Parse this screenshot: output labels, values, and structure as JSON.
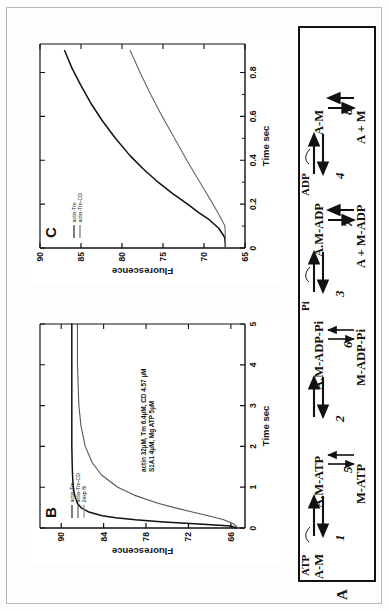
{
  "figure": {
    "panels": [
      "A",
      "B",
      "C"
    ]
  },
  "panelA": {
    "label": "A",
    "species": {
      "am_left": "A-M",
      "am_atp": "A.M-ATP",
      "am_adp_pi": "A.M-ADP-Pi",
      "am_adp": "A.M-ADP",
      "am_right": "A-M",
      "m_atp": "M-ATP",
      "m_adp_pi": "M-ADP-Pi",
      "a_plus_m_adp": "A + M-ADP",
      "a_plus_m": "A + M"
    },
    "ligands": {
      "atp": "ATP",
      "pi": "Pi",
      "adp": "ADP"
    },
    "steps": {
      "s1": "1",
      "s2": "2",
      "s3": "3",
      "s4": "4",
      "s5": "5",
      "s6": "6",
      "s7": "7",
      "s8": "8"
    }
  },
  "chart_data": [
    {
      "id": "panelB",
      "type": "line",
      "title": "B",
      "xlabel": "Time sec",
      "ylabel": "Fluorescence",
      "xlim": [
        0,
        5
      ],
      "ylim": [
        64,
        93
      ],
      "xticks": [
        "0",
        "1",
        "2",
        "3",
        "4",
        "5"
      ],
      "xtickvals": [
        0,
        1,
        2,
        3,
        4,
        5
      ],
      "yticks": [
        "66",
        "72",
        "78",
        "84",
        "90"
      ],
      "ytickvals": [
        66,
        72,
        78,
        84,
        90
      ],
      "grid": false,
      "legend_position": "upper-left",
      "annotation": [
        "actin 32µM, Tm 6.4µM, CD 4.57 µM",
        "S1A1 4µM, Mg ATP 5µM"
      ],
      "legend": [
        {
          "name": "actin-Tm",
          "color": "#111111"
        },
        {
          "name": "actin-Tm-CD",
          "color": "#555555"
        },
        {
          "name": "2exp fit",
          "color": "#888888"
        }
      ],
      "series": [
        {
          "name": "actin-Tm",
          "color": "#111111",
          "x": [
            0,
            0.05,
            0.1,
            0.15,
            0.2,
            0.25,
            0.3,
            0.4,
            0.5,
            0.6,
            0.8,
            1.0,
            1.3,
            1.6,
            2.0,
            2.5,
            3.0,
            3.5,
            4.0,
            4.5,
            5.0
          ],
          "y": [
            65.2,
            66.0,
            70.5,
            75.5,
            79.5,
            82.3,
            84.2,
            86.2,
            87.2,
            87.7,
            88.1,
            88.3,
            88.4,
            88.45,
            88.5,
            88.5,
            88.5,
            88.5,
            88.5,
            88.5,
            88.5
          ]
        },
        {
          "name": "actin-Tm-CD",
          "color": "#555555",
          "x": [
            0,
            0.1,
            0.2,
            0.3,
            0.4,
            0.5,
            0.6,
            0.8,
            1.0,
            1.3,
            1.6,
            2.0,
            2.5,
            3.0,
            3.5,
            4.0,
            4.5,
            5.0
          ],
          "y": [
            65.0,
            65.6,
            67.0,
            69.2,
            71.6,
            74.0,
            76.2,
            79.6,
            82.0,
            84.3,
            85.6,
            86.6,
            87.2,
            87.5,
            87.6,
            87.7,
            87.7,
            87.7
          ]
        }
      ]
    },
    {
      "id": "panelC",
      "type": "line",
      "title": "C",
      "xlabel": "Time sec",
      "ylabel": "Fluorescence",
      "xlim": [
        0,
        0.93
      ],
      "ylim": [
        65,
        90
      ],
      "xticks": [
        "0",
        "0.2",
        "0.4",
        "0.6",
        "0.8"
      ],
      "xtickvals": [
        0,
        0.2,
        0.4,
        0.6,
        0.8
      ],
      "yticks": [
        "65",
        "70",
        "75",
        "80",
        "85",
        "90"
      ],
      "ytickvals": [
        65,
        70,
        75,
        80,
        85,
        90
      ],
      "grid": false,
      "legend_position": "upper-left",
      "legend": [
        {
          "name": "actin-Tm",
          "color": "#111111"
        },
        {
          "name": "actin-Tm-CD",
          "color": "#666666"
        }
      ],
      "series": [
        {
          "name": "actin-Tm",
          "color": "#111111",
          "x": [
            0,
            0.02,
            0.05,
            0.09,
            0.13,
            0.16,
            0.2,
            0.25,
            0.3,
            0.36,
            0.42,
            0.5,
            0.58,
            0.66,
            0.74,
            0.82,
            0.9
          ],
          "y": [
            67.4,
            67.4,
            67.5,
            68.2,
            69.4,
            70.6,
            72.0,
            73.9,
            75.6,
            77.4,
            79.0,
            80.8,
            82.4,
            83.8,
            85.0,
            86.1,
            87.0
          ]
        },
        {
          "name": "actin-Tm-CD",
          "color": "#666666",
          "x": [
            0,
            0.05,
            0.1,
            0.14,
            0.2,
            0.3,
            0.4,
            0.5,
            0.6,
            0.7,
            0.8,
            0.9
          ],
          "y": [
            67.4,
            67.4,
            67.45,
            68.0,
            68.9,
            70.5,
            72.1,
            73.6,
            75.1,
            76.5,
            77.8,
            79.0
          ]
        }
      ]
    }
  ]
}
